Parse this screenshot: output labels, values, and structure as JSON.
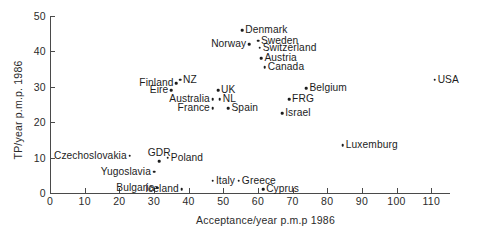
{
  "chart_data": {
    "type": "scatter",
    "title": "",
    "xlabel": "Acceptance/year p.m.p 1986",
    "ylabel": "TP/year p.m.p. 1986",
    "xlim": [
      0,
      115
    ],
    "ylim": [
      0,
      50
    ],
    "xticks": [
      0,
      10,
      20,
      30,
      40,
      50,
      60,
      70,
      80,
      90,
      100,
      110
    ],
    "yticks": [
      0,
      10,
      20,
      30,
      40,
      50
    ],
    "grid": false,
    "legend": "none",
    "points": [
      {
        "label": "Denmark",
        "x": 55.5,
        "y": 46.0,
        "pos": "right"
      },
      {
        "label": "Sweden",
        "x": 60.0,
        "y": 43.0,
        "pos": "right"
      },
      {
        "label": "Norway",
        "x": 57.5,
        "y": 42.0,
        "pos": "left"
      },
      {
        "label": "Switzerland",
        "x": 60.5,
        "y": 41.0,
        "pos": "right"
      },
      {
        "label": "Austria",
        "x": 61.0,
        "y": 38.0,
        "pos": "right"
      },
      {
        "label": "Canada",
        "x": 62.0,
        "y": 35.5,
        "pos": "right"
      },
      {
        "label": "Belgium",
        "x": 74.0,
        "y": 29.5,
        "pos": "right"
      },
      {
        "label": "FRG",
        "x": 69.0,
        "y": 26.5,
        "pos": "right"
      },
      {
        "label": "Israel",
        "x": 67.0,
        "y": 22.5,
        "pos": "right"
      },
      {
        "label": "USA",
        "x": 111.0,
        "y": 32.0,
        "pos": "right"
      },
      {
        "label": "Luxemburg",
        "x": 84.5,
        "y": 13.5,
        "pos": "right"
      },
      {
        "label": "NZ",
        "x": 37.5,
        "y": 32.0,
        "pos": "right"
      },
      {
        "label": "Finland",
        "x": 36.5,
        "y": 31.0,
        "pos": "left"
      },
      {
        "label": "Eire",
        "x": 35.0,
        "y": 29.0,
        "pos": "left"
      },
      {
        "label": "UK",
        "x": 48.5,
        "y": 29.0,
        "pos": "right"
      },
      {
        "label": "NL",
        "x": 49.0,
        "y": 26.5,
        "pos": "right"
      },
      {
        "label": "Australia",
        "x": 47.0,
        "y": 26.5,
        "pos": "left"
      },
      {
        "label": "France",
        "x": 47.0,
        "y": 24.0,
        "pos": "left"
      },
      {
        "label": "Spain",
        "x": 51.5,
        "y": 24.0,
        "pos": "right"
      },
      {
        "label": "Czechoslovakia",
        "x": 23.0,
        "y": 10.5,
        "pos": "left"
      },
      {
        "label": "GDR",
        "x": 31.5,
        "y": 9.0,
        "pos": "above"
      },
      {
        "label": "Poland",
        "x": 34.0,
        "y": 10.0,
        "pos": "right"
      },
      {
        "label": "Yugoslavia",
        "x": 30.0,
        "y": 6.0,
        "pos": "left"
      },
      {
        "label": "Bulgaria",
        "x": 31.0,
        "y": 1.5,
        "pos": "left"
      },
      {
        "label": "Iceland",
        "x": 38.0,
        "y": 1.0,
        "pos": "left"
      },
      {
        "label": "Italy",
        "x": 47.0,
        "y": 3.5,
        "pos": "right"
      },
      {
        "label": "Greece",
        "x": 54.5,
        "y": 3.5,
        "pos": "right"
      },
      {
        "label": "Cyprus",
        "x": 61.5,
        "y": 1.0,
        "pos": "right"
      }
    ]
  }
}
